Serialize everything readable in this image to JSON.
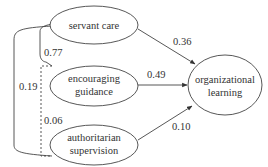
{
  "diagram": {
    "type": "path-model",
    "nodes": [
      {
        "id": "servant_care",
        "lines": [
          "servant care"
        ]
      },
      {
        "id": "encouraging_guidance",
        "lines": [
          "encouraging",
          "guidance"
        ]
      },
      {
        "id": "authoritarian_supervision",
        "lines": [
          "authoritarian",
          "supervision"
        ]
      },
      {
        "id": "organizational_learning",
        "lines": [
          "organizational",
          "learning"
        ]
      }
    ],
    "paths": [
      {
        "from": "servant_care",
        "to": "organizational_learning",
        "coefficient": "0.36"
      },
      {
        "from": "encouraging_guidance",
        "to": "organizational_learning",
        "coefficient": "0.49"
      },
      {
        "from": "authoritarian_supervision",
        "to": "organizational_learning",
        "coefficient": "0.10"
      }
    ],
    "correlations": [
      {
        "between": [
          "servant_care",
          "encouraging_guidance"
        ],
        "value": "0.77",
        "style": "solid"
      },
      {
        "between": [
          "servant_care",
          "authoritarian_supervision"
        ],
        "value": "0.19",
        "style": "solid"
      },
      {
        "between": [
          "encouraging_guidance",
          "authoritarian_supervision"
        ],
        "value": "0.06",
        "style": "dashed"
      }
    ]
  }
}
